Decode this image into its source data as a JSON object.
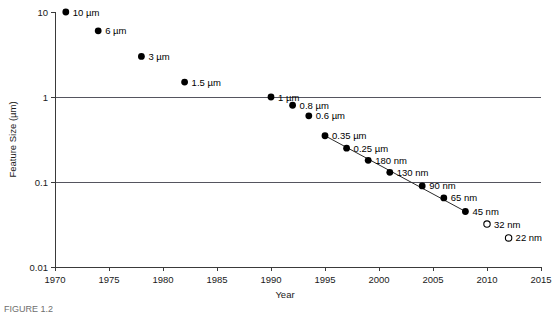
{
  "figure": {
    "caption": "FIGURE 1.2"
  },
  "chart_data": {
    "type": "scatter",
    "title": "",
    "xlabel": "Year",
    "ylabel": "Feature Size (µm)",
    "xlim": [
      1970,
      2015
    ],
    "ylim": [
      0.01,
      10
    ],
    "yscale": "log",
    "grid": true,
    "gridlines_y": [
      1,
      0.1
    ],
    "legend": "none",
    "xticks": [
      1970,
      1975,
      1980,
      1985,
      1990,
      1995,
      2000,
      2005,
      2010,
      2015
    ],
    "xticklabels": [
      "1970",
      "1975",
      "1980",
      "1985",
      "1990",
      "1995",
      "2000",
      "2005",
      "2010",
      "2015"
    ],
    "yticks": [
      10,
      1,
      0.1,
      0.01
    ],
    "yticklabels": [
      "10",
      "1",
      "0.1",
      "0.01"
    ],
    "series": [
      {
        "name": "Feature size nodes",
        "marker": "filled-circle",
        "points": [
          {
            "label": "10 µm",
            "x": 1971,
            "y": 10,
            "marker": "filled"
          },
          {
            "label": "6 µm",
            "x": 1974,
            "y": 6,
            "marker": "filled"
          },
          {
            "label": "3 µm",
            "x": 1978,
            "y": 3,
            "marker": "filled"
          },
          {
            "label": "1.5 µm",
            "x": 1982,
            "y": 1.5,
            "marker": "filled"
          },
          {
            "label": "1 µm",
            "x": 1990,
            "y": 1,
            "marker": "filled"
          },
          {
            "label": "0.8 µm",
            "x": 1992,
            "y": 0.8,
            "marker": "filled"
          },
          {
            "label": "0.6 µm",
            "x": 1993.5,
            "y": 0.6,
            "marker": "filled"
          },
          {
            "label": "0.35 µm",
            "x": 1995,
            "y": 0.35,
            "marker": "filled"
          },
          {
            "label": "0.25 µm",
            "x": 1997,
            "y": 0.25,
            "marker": "filled"
          },
          {
            "label": "180 nm",
            "x": 1999,
            "y": 0.18,
            "marker": "filled"
          },
          {
            "label": "130 nm",
            "x": 2001,
            "y": 0.13,
            "marker": "filled"
          },
          {
            "label": "90 nm",
            "x": 2004,
            "y": 0.09,
            "marker": "filled"
          },
          {
            "label": "65 nm",
            "x": 2006,
            "y": 0.065,
            "marker": "filled"
          },
          {
            "label": "45 nm",
            "x": 2008,
            "y": 0.045,
            "marker": "filled"
          },
          {
            "label": "32 nm",
            "x": 2010,
            "y": 0.032,
            "marker": "open"
          },
          {
            "label": "22 nm",
            "x": 2012,
            "y": 0.022,
            "marker": "open"
          }
        ]
      }
    ],
    "trend_line": {
      "from_label": "0.35 µm",
      "to_label": "45 nm",
      "style": "solid"
    }
  }
}
